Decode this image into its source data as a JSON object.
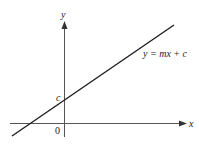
{
  "diagram": {
    "axes": {
      "x_label": "x",
      "y_label": "y",
      "origin_label": "0"
    },
    "line": {
      "equation_label": "y = mx + c",
      "intercept_label": "c",
      "slope_sign": "positive",
      "y_intercept": "c",
      "color": "#1e1e1e"
    },
    "colors": {
      "axis": "#555555",
      "text": "#222222",
      "background": "#ffffff"
    }
  }
}
